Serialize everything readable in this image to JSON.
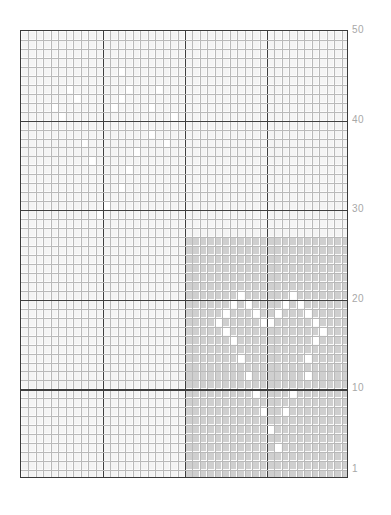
{
  "figure": {
    "type": "heatmap-grid",
    "title": "",
    "background": "#ffffff",
    "plot_border_color": "#3a3a3a"
  },
  "axis": {
    "y_ticks": [
      {
        "label": "50",
        "value": 50
      },
      {
        "label": "40",
        "value": 40
      },
      {
        "label": "30",
        "value": 30
      },
      {
        "label": "20",
        "value": 20
      },
      {
        "label": "10",
        "value": 10
      },
      {
        "label": "1",
        "value": 1
      }
    ],
    "y_tick_color": "#a8a8a8",
    "x_ticks": []
  },
  "chart_data": {
    "type": "heatmap",
    "title": "",
    "xlabel": "",
    "ylabel": "",
    "n_cols": 44,
    "n_rows": 50,
    "xlim": [
      0,
      44
    ],
    "ylim": [
      1,
      50
    ],
    "grid": true,
    "legend": "none",
    "yticklabels": [
      "1",
      "10",
      "20",
      "30",
      "40",
      "50"
    ],
    "ytickvalues": [
      1,
      10,
      20,
      30,
      40,
      50
    ],
    "colors": {
      "low": "#f4f4f4",
      "high": "#cfcfcf",
      "highlight": "#ffffff",
      "minor_grid": "#bdbdbd",
      "major_grid": "#3f3f3f"
    },
    "major_grid_rows": [
      10,
      20,
      30,
      40
    ],
    "major_grid_cols": [
      11,
      22,
      33
    ],
    "regions": [
      {
        "name": "low-density-region",
        "value": 0.08,
        "fill": "#f4f4f4",
        "col_start": 0,
        "col_end": 44,
        "row_start": 1,
        "row_end": 50
      },
      {
        "name": "high-density-region",
        "value": 0.62,
        "fill": "#cfcfcf",
        "col_start": 22,
        "col_end": 44,
        "row_start": 1,
        "row_end": 27
      }
    ],
    "highlight_cells_high_region": [
      {
        "col": 29,
        "row": 21
      },
      {
        "col": 36,
        "row": 21
      },
      {
        "col": 28,
        "row": 20
      },
      {
        "col": 30,
        "row": 20
      },
      {
        "col": 35,
        "row": 20
      },
      {
        "col": 37,
        "row": 20
      },
      {
        "col": 27,
        "row": 19
      },
      {
        "col": 31,
        "row": 19
      },
      {
        "col": 34,
        "row": 19
      },
      {
        "col": 38,
        "row": 19
      },
      {
        "col": 26,
        "row": 18
      },
      {
        "col": 32,
        "row": 18
      },
      {
        "col": 33,
        "row": 18
      },
      {
        "col": 39,
        "row": 18
      },
      {
        "col": 27,
        "row": 17
      },
      {
        "col": 40,
        "row": 17
      },
      {
        "col": 28,
        "row": 16
      },
      {
        "col": 39,
        "row": 16
      },
      {
        "col": 29,
        "row": 14
      },
      {
        "col": 38,
        "row": 14
      },
      {
        "col": 30,
        "row": 12
      },
      {
        "col": 38,
        "row": 12
      },
      {
        "col": 31,
        "row": 10
      },
      {
        "col": 36,
        "row": 10
      },
      {
        "col": 32,
        "row": 8
      },
      {
        "col": 35,
        "row": 8
      },
      {
        "col": 33,
        "row": 6
      },
      {
        "col": 34,
        "row": 4
      }
    ],
    "highlight_cells_low_region": [
      {
        "col": 13,
        "row": 46
      },
      {
        "col": 6,
        "row": 44
      },
      {
        "col": 14,
        "row": 44
      },
      {
        "col": 18,
        "row": 44
      },
      {
        "col": 7,
        "row": 43
      },
      {
        "col": 13,
        "row": 43
      },
      {
        "col": 12,
        "row": 42
      },
      {
        "col": 4,
        "row": 42
      },
      {
        "col": 17,
        "row": 42
      },
      {
        "col": 5,
        "row": 41
      },
      {
        "col": 20,
        "row": 41
      },
      {
        "col": 17,
        "row": 39
      },
      {
        "col": 19,
        "row": 38
      },
      {
        "col": 8,
        "row": 38
      },
      {
        "col": 15,
        "row": 37
      },
      {
        "col": 9,
        "row": 36
      },
      {
        "col": 14,
        "row": 35
      },
      {
        "col": 13,
        "row": 33
      },
      {
        "col": 11,
        "row": 31
      },
      {
        "col": 10,
        "row": 30
      }
    ]
  }
}
